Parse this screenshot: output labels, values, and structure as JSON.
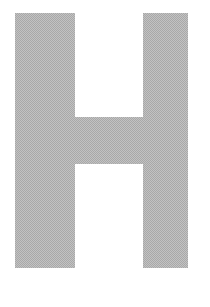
{
  "image": {
    "subject": "letter-h",
    "character": "H",
    "case": "uppercase",
    "description": "Uppercase letter H rendered as a dithered halftone gray glyph on a plain white background",
    "background_color": "#ffffff",
    "glyph_color": "#a8a8a8",
    "texture": "halftone-dither",
    "canvas": {
      "width": 210,
      "height": 307
    },
    "glyph_bounds": {
      "left": 15,
      "top": 13,
      "right": 188,
      "bottom": 268,
      "width": 173,
      "height": 255
    },
    "parts": [
      {
        "name": "left-stem",
        "left": 15,
        "top": 13,
        "width": 60,
        "height": 255
      },
      {
        "name": "right-stem",
        "left": 143,
        "top": 13,
        "width": 45,
        "height": 255
      },
      {
        "name": "crossbar",
        "left": 15,
        "top": 117,
        "width": 173,
        "height": 47
      }
    ],
    "counters": [
      {
        "name": "upper-counter",
        "left": 75,
        "top": 13,
        "width": 68,
        "height": 104
      },
      {
        "name": "lower-counter",
        "left": 75,
        "top": 164,
        "width": 68,
        "height": 104
      }
    ]
  }
}
